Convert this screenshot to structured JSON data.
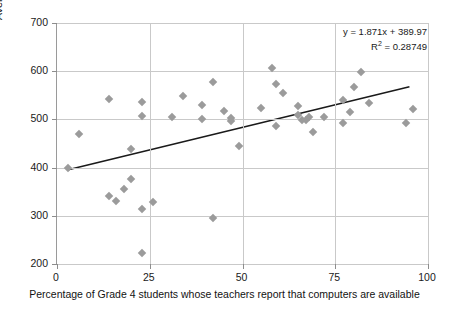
{
  "chart_data": {
    "type": "scatter",
    "title": "",
    "xlabel": "Percentage of Grade 4 students whose teachers report that computers are available",
    "ylabel": "Average Student Score for system: TIMSS 2007 Grade 4",
    "xlim": [
      0,
      100
    ],
    "ylim": [
      200,
      700
    ],
    "xticks": [
      0,
      25,
      50,
      75,
      100
    ],
    "yticks": [
      200,
      300,
      400,
      500,
      600,
      700
    ],
    "grid": true,
    "legend": "none",
    "annotations": {
      "equation": "y = 1.871x + 389.97",
      "r_squared_prefix": "R",
      "r_squared_sup": "2",
      "r_squared_value": " = 0.28749"
    },
    "trendline": {
      "slope": 1.871,
      "intercept": 389.97,
      "x_start": 3,
      "x_end": 95,
      "color": "#1a1a1a"
    },
    "marker": {
      "shape": "diamond",
      "color": "#9b9b9b",
      "size": 6
    },
    "points": [
      {
        "x": 3,
        "y": 400
      },
      {
        "x": 6,
        "y": 469
      },
      {
        "x": 14,
        "y": 543
      },
      {
        "x": 14,
        "y": 341
      },
      {
        "x": 16,
        "y": 330
      },
      {
        "x": 18,
        "y": 356
      },
      {
        "x": 20,
        "y": 439
      },
      {
        "x": 20,
        "y": 377
      },
      {
        "x": 23,
        "y": 536
      },
      {
        "x": 23,
        "y": 508
      },
      {
        "x": 23,
        "y": 315
      },
      {
        "x": 23,
        "y": 223
      },
      {
        "x": 26,
        "y": 328
      },
      {
        "x": 31,
        "y": 506
      },
      {
        "x": 34,
        "y": 549
      },
      {
        "x": 39,
        "y": 529
      },
      {
        "x": 39,
        "y": 501
      },
      {
        "x": 42,
        "y": 577
      },
      {
        "x": 42,
        "y": 296
      },
      {
        "x": 45,
        "y": 517
      },
      {
        "x": 47,
        "y": 503
      },
      {
        "x": 47,
        "y": 496
      },
      {
        "x": 49,
        "y": 445
      },
      {
        "x": 55,
        "y": 523
      },
      {
        "x": 58,
        "y": 606
      },
      {
        "x": 59,
        "y": 573
      },
      {
        "x": 59,
        "y": 487
      },
      {
        "x": 61,
        "y": 554
      },
      {
        "x": 65,
        "y": 527
      },
      {
        "x": 65,
        "y": 510
      },
      {
        "x": 66,
        "y": 499
      },
      {
        "x": 67,
        "y": 498
      },
      {
        "x": 68,
        "y": 504
      },
      {
        "x": 69,
        "y": 473
      },
      {
        "x": 72,
        "y": 504
      },
      {
        "x": 77,
        "y": 541
      },
      {
        "x": 77,
        "y": 493
      },
      {
        "x": 79,
        "y": 515
      },
      {
        "x": 80,
        "y": 568
      },
      {
        "x": 82,
        "y": 599
      },
      {
        "x": 84,
        "y": 534
      },
      {
        "x": 94,
        "y": 493
      },
      {
        "x": 96,
        "y": 521
      }
    ]
  },
  "axis": {
    "y_tick_labels": [
      "700",
      "600",
      "500",
      "400",
      "300",
      "200"
    ],
    "x_tick_labels": [
      "0",
      "25",
      "50",
      "75",
      "100"
    ]
  }
}
